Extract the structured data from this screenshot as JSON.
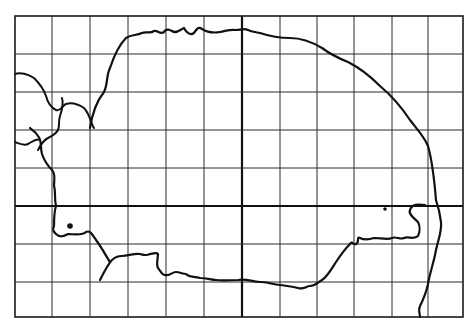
{
  "map": {
    "type": "grid distribution map",
    "frame": {
      "left": 15,
      "top": 16,
      "right": 463,
      "bottom": 317
    },
    "grid": {
      "vertical_lines": [
        52,
        90,
        128,
        166,
        204,
        242,
        280,
        317,
        354,
        392,
        428
      ],
      "horizontal_lines": [
        54,
        92,
        130,
        168,
        206,
        244,
        282
      ],
      "major_vertical": 242,
      "major_horizontal": 206
    },
    "records": [
      {
        "label": "record-west",
        "x": 70,
        "y": 226,
        "r": 2.8
      },
      {
        "label": "record-east",
        "x": 385,
        "y": 209,
        "r": 1.8
      }
    ],
    "colors": {
      "ink": "#111111",
      "background": "#ffffff"
    }
  }
}
